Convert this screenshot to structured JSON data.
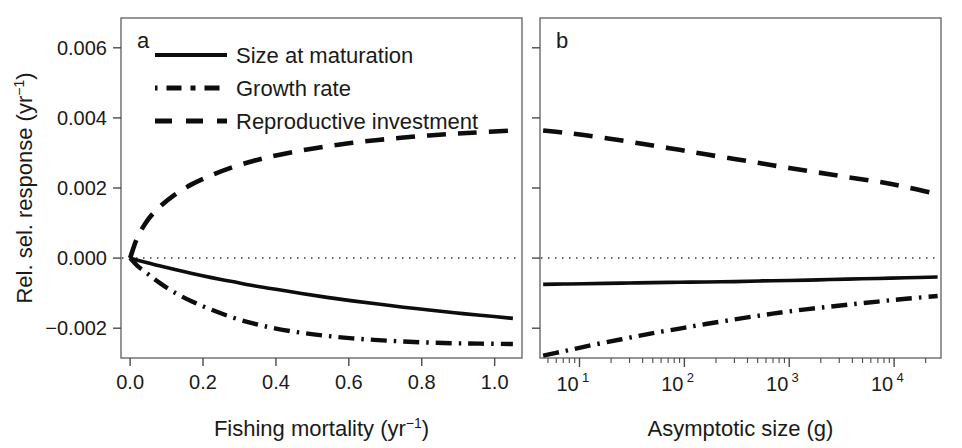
{
  "figure": {
    "background": "#ffffff",
    "line_color": "#0d0d0d",
    "axis_color": "#4a4a4a",
    "width": 962,
    "height": 448
  },
  "legend": {
    "entries": [
      {
        "label": "Size at maturation",
        "style": "solid"
      },
      {
        "label": "Growth rate",
        "style": "dashdot"
      },
      {
        "label": "Reproductive investment",
        "style": "dashed"
      }
    ]
  },
  "chart_data": [
    {
      "type": "line",
      "panel": "a",
      "panel_label": "a",
      "title": "",
      "xlabel": "Fishing mortality (yr",
      "xlabel_sup": "-1",
      "xlabel_tail": ")",
      "ylabel": "Rel. sel. response (yr",
      "ylabel_sup": "-1",
      "ylabel_tail": ")",
      "xscale": "linear",
      "yscale": "linear",
      "xlim": [
        -0.025,
        1.075
      ],
      "ylim": [
        -0.00285,
        0.00685
      ],
      "grid": false,
      "legend_position": "top-left",
      "xticks": [
        0.0,
        0.2,
        0.4,
        0.6,
        0.8,
        1.0
      ],
      "xticklabels": [
        "0.0",
        "0.2",
        "0.4",
        "0.6",
        "0.8",
        "1.0"
      ],
      "yticks": [
        -0.002,
        0.0,
        0.002,
        0.004,
        0.006
      ],
      "yticklabels": [
        "-0.002",
        "0.000",
        "0.002",
        "0.004",
        "0.006"
      ],
      "zero_reference_line": 0.0,
      "x": [
        0.0,
        0.02,
        0.05,
        0.08,
        0.12,
        0.17,
        0.22,
        0.28,
        0.34,
        0.4,
        0.47,
        0.54,
        0.61,
        0.68,
        0.75,
        0.82,
        0.89,
        0.96,
        1.05
      ],
      "series": [
        {
          "name": "Size at maturation",
          "style": "solid",
          "values": [
            0.0,
            -6e-05,
            -0.00014,
            -0.00022,
            -0.00032,
            -0.00044,
            -0.00055,
            -0.00067,
            -0.00079,
            -0.00089,
            -0.00101,
            -0.00112,
            -0.00122,
            -0.00131,
            -0.0014,
            -0.00148,
            -0.00156,
            -0.00163,
            -0.00172
          ]
        },
        {
          "name": "Growth rate",
          "style": "dashdot",
          "values": [
            0.0,
            -0.00022,
            -0.00046,
            -0.0007,
            -0.00097,
            -0.00124,
            -0.00146,
            -0.00169,
            -0.00187,
            -0.00201,
            -0.00213,
            -0.00222,
            -0.00229,
            -0.00234,
            -0.00238,
            -0.00241,
            -0.00243,
            -0.00244,
            -0.00245
          ]
        },
        {
          "name": "Reproductive investment",
          "style": "dashed",
          "values": [
            0.0,
            0.00059,
            0.00111,
            0.00145,
            0.00179,
            0.00211,
            0.00235,
            0.00259,
            0.00278,
            0.00293,
            0.00307,
            0.00319,
            0.00329,
            0.00337,
            0.00344,
            0.0035,
            0.00355,
            0.00359,
            0.00364
          ]
        }
      ]
    },
    {
      "type": "line",
      "panel": "b",
      "panel_label": "b",
      "title": "",
      "xlabel": "Asymptotic size (g)",
      "xscale": "log",
      "yscale": "linear",
      "xlim": [
        4.2,
        28000
      ],
      "ylim": [
        -0.00285,
        0.00685
      ],
      "grid": false,
      "legend_position": "none",
      "xticks": [
        10,
        100,
        1000,
        10000
      ],
      "xticklabels": [
        "10",
        "10",
        "10",
        "10"
      ],
      "xtick_exponents": [
        "1",
        "2",
        "3",
        "4"
      ],
      "yticks": [
        -0.002,
        0.0,
        0.002,
        0.004,
        0.006
      ],
      "yticklabels": [
        "",
        "",
        "",
        "",
        ""
      ],
      "zero_reference_line": 0.0,
      "x": [
        4.5,
        7,
        11,
        18,
        30,
        50,
        90,
        160,
        300,
        550,
        1000,
        1900,
        3600,
        7000,
        13000,
        26000
      ],
      "series": [
        {
          "name": "Size at maturation",
          "style": "solid",
          "values": [
            -0.00075,
            -0.00074,
            -0.00073,
            -0.00072,
            -0.00071,
            -0.0007,
            -0.00069,
            -0.00068,
            -0.00067,
            -0.00065,
            -0.00064,
            -0.00062,
            -0.0006,
            -0.00058,
            -0.00056,
            -0.00054
          ]
        },
        {
          "name": "Growth rate",
          "style": "dashdot",
          "values": [
            -0.00278,
            -0.00266,
            -0.00253,
            -0.0024,
            -0.00227,
            -0.00214,
            -0.00201,
            -0.00188,
            -0.00175,
            -0.00163,
            -0.00152,
            -0.00142,
            -0.00133,
            -0.00124,
            -0.00116,
            -0.00108
          ]
        },
        {
          "name": "Reproductive investment",
          "style": "dashed",
          "values": [
            0.00364,
            0.00358,
            0.00351,
            0.00342,
            0.00332,
            0.00321,
            0.00309,
            0.00296,
            0.00283,
            0.0027,
            0.00257,
            0.00244,
            0.00231,
            0.00218,
            0.00203,
            0.00182
          ]
        }
      ]
    }
  ]
}
